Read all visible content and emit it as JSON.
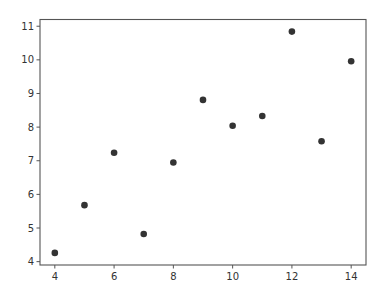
{
  "chart_data": {
    "type": "scatter",
    "title": "",
    "xlabel": "",
    "ylabel": "",
    "x": [
      10,
      8,
      13,
      9,
      11,
      14,
      6,
      4,
      12,
      7,
      5
    ],
    "y": [
      8.04,
      6.95,
      7.58,
      8.81,
      8.33,
      9.96,
      7.24,
      4.26,
      10.84,
      4.82,
      5.68
    ],
    "xlim": [
      3.5,
      14.5
    ],
    "ylim": [
      3.9,
      11.2
    ],
    "xticks": [
      4,
      6,
      8,
      10,
      12,
      14
    ],
    "yticks": [
      4,
      5,
      6,
      7,
      8,
      9,
      10,
      11
    ],
    "xtick_labels": [
      "4",
      "6",
      "8",
      "10",
      "12",
      "14"
    ],
    "ytick_labels": [
      "4",
      "5",
      "6",
      "7",
      "8",
      "9",
      "10",
      "11"
    ],
    "grid": false,
    "legend": null,
    "marker_color": "#333333"
  }
}
